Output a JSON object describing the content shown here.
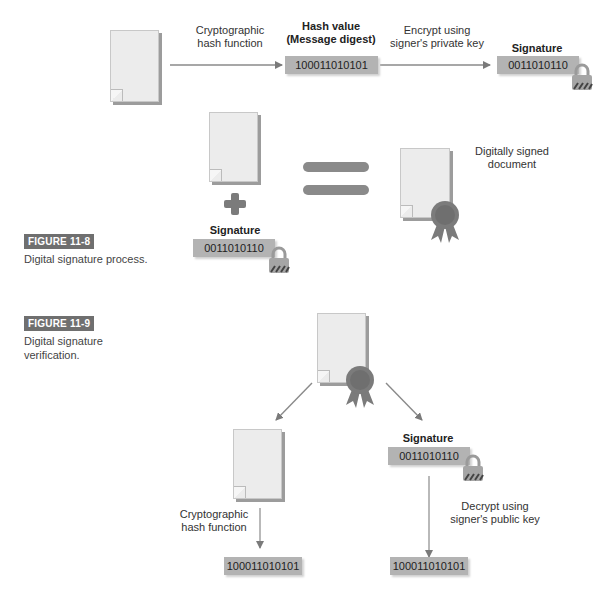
{
  "figure_8": {
    "badge": "FIGURE 11-8",
    "caption": "Digital signature process.",
    "step1_label_line1": "Cryptographic",
    "step1_label_line2": "hash function",
    "hash_title_line1": "Hash value",
    "hash_title_line2": "(Message digest)",
    "hash_value": "100011010101",
    "step2_label_line1": "Encrypt using",
    "step2_label_line2": "signer's private key",
    "signature_title": "Signature",
    "signature_value": "0011010110",
    "combine_signature_title": "Signature",
    "combine_signature_value": "0011010110",
    "result_label_line1": "Digitally signed",
    "result_label_line2": "document"
  },
  "figure_9": {
    "badge": "FIGURE 11-9",
    "caption_line1": "Digital signature",
    "caption_line2": "verification.",
    "left_label_line1": "Cryptographic",
    "left_label_line2": "hash function",
    "left_hash_value": "100011010101",
    "signature_title": "Signature",
    "signature_value": "0011010110",
    "right_label_line1": "Decrypt using",
    "right_label_line2": "signer's public key",
    "right_hash_value": "100011010101"
  },
  "colors": {
    "arrow": "#7a7a7a",
    "binary_box": "#b3b3b3",
    "badge": "#6f6f6f",
    "seal": "#7b7b7b"
  }
}
